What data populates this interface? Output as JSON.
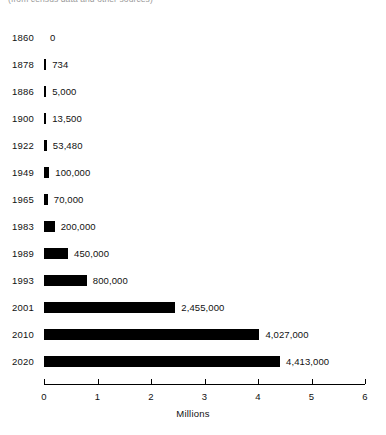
{
  "header": {
    "note": "(from census data and other sources)"
  },
  "chart_data": {
    "type": "bar",
    "orientation": "horizontal",
    "title": "",
    "xlabel": "Millions",
    "ylabel": "",
    "xlim": [
      0,
      6
    ],
    "xticks": [
      "0",
      "1",
      "2",
      "3",
      "4",
      "5",
      "6"
    ],
    "grid": false,
    "legend": null,
    "bar_color": "#000000",
    "categories": [
      "1860",
      "1878",
      "1886",
      "1900",
      "1922",
      "1949",
      "1965",
      "1983",
      "1989",
      "1993",
      "2001",
      "2010",
      "2020"
    ],
    "values": [
      0,
      734,
      5000,
      13500,
      53480,
      100000,
      70000,
      200000,
      450000,
      800000,
      2455000,
      4027000,
      4413000
    ],
    "value_labels": [
      "0",
      "734",
      "5,000",
      "13,500",
      "53,480",
      "100,000",
      "70,000",
      "200,000",
      "450,000",
      "800,000",
      "2,455,000",
      "4,027,000",
      "4,413,000"
    ]
  }
}
